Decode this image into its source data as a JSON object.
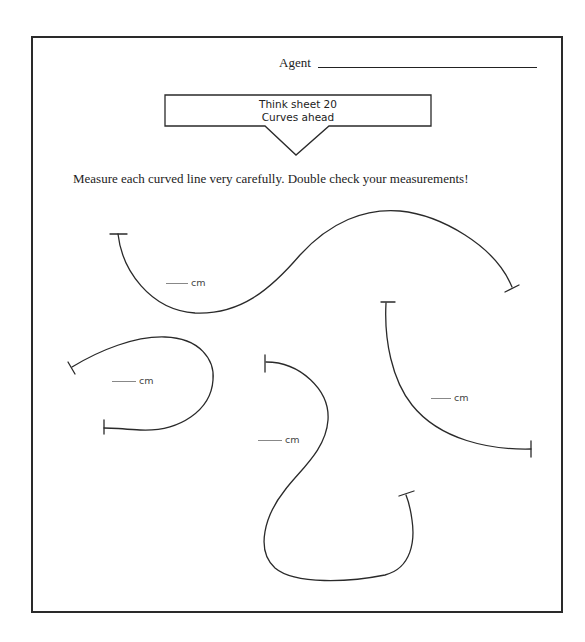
{
  "header": {
    "agent_label": "Agent",
    "agent_value": ""
  },
  "title_box": {
    "line1": "Think sheet 20",
    "line2": "Curves ahead"
  },
  "instructions": "Measure each curved line very carefully. Double check your measurements!",
  "curves": [
    {
      "id": 1,
      "answer": "",
      "unit": "cm"
    },
    {
      "id": 2,
      "answer": "",
      "unit": "cm"
    },
    {
      "id": 3,
      "answer": "",
      "unit": "cm"
    },
    {
      "id": 4,
      "answer": "",
      "unit": "cm"
    }
  ],
  "colors": {
    "ink": "#222222",
    "paper": "#ffffff"
  }
}
